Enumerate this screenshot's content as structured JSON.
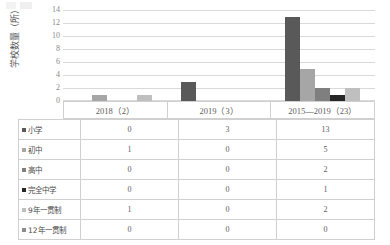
{
  "chart_data": {
    "type": "bar",
    "title": "",
    "xlabel": "",
    "ylabel": "学校数量（所）",
    "ylim": [
      0,
      14
    ],
    "yticks": [
      14,
      12,
      10,
      8,
      6,
      4,
      2,
      0
    ],
    "grid": true,
    "legend_position": "table-row-headers",
    "categories": [
      "2018（2）",
      "2019（3）",
      "2015—2019（23）"
    ],
    "series": [
      {
        "name": "小学",
        "values": [
          0,
          3,
          13
        ],
        "color": "#595959"
      },
      {
        "name": "初中",
        "values": [
          1,
          0,
          5
        ],
        "color": "#a6a6a6"
      },
      {
        "name": "高中",
        "values": [
          0,
          0,
          2
        ],
        "color": "#7f7f7f"
      },
      {
        "name": "完全中学",
        "values": [
          0,
          0,
          1
        ],
        "color": "#262626"
      },
      {
        "name": "9年一贯制",
        "values": [
          1,
          0,
          2
        ],
        "color": "#bfbfbf"
      },
      {
        "name": "12年一贯制",
        "values": [
          0,
          0,
          0
        ],
        "color": "#8c8c8c"
      }
    ]
  },
  "axis": {
    "y_label": "学校数量（所）",
    "y_ticks": [
      "14",
      "12",
      "10",
      "8",
      "6",
      "4",
      "2",
      "0"
    ]
  },
  "x_categories": [
    {
      "label": "2018（2）"
    },
    {
      "label": "2019（3）"
    },
    {
      "label": "2015—2019（23）"
    }
  ],
  "table": {
    "rows": [
      {
        "label": "小学",
        "color": "#595959",
        "values": [
          "0",
          "3",
          "13"
        ]
      },
      {
        "label": "初中",
        "color": "#a6a6a6",
        "values": [
          "1",
          "0",
          "5"
        ]
      },
      {
        "label": "高中",
        "color": "#7f7f7f",
        "values": [
          "0",
          "0",
          "2"
        ]
      },
      {
        "label": "完全中学",
        "color": "#262626",
        "values": [
          "0",
          "0",
          "1"
        ]
      },
      {
        "label": "9年一贯制",
        "color": "#bfbfbf",
        "values": [
          "1",
          "0",
          "2"
        ]
      },
      {
        "label": "12年一贯制",
        "color": "#8c8c8c",
        "values": [
          "0",
          "0",
          "0"
        ]
      }
    ]
  },
  "style": {
    "grid_color": "#d9d9d9",
    "border_color": "#d0d0d0",
    "text_color": "#5d5d5d"
  }
}
